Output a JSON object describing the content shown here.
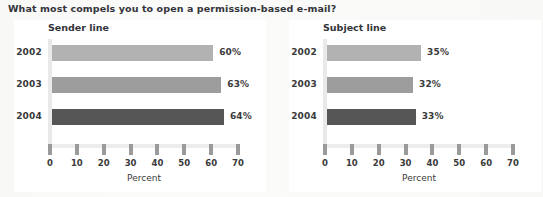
{
  "figure": {
    "title": "What most compels you to open a permission-based e-mail?"
  },
  "axis": {
    "title": "Percent",
    "ticks": [
      "0",
      "10",
      "20",
      "30",
      "40",
      "50",
      "60",
      "70"
    ]
  },
  "panels": [
    {
      "key": "sender",
      "title": "Sender line",
      "rows": [
        {
          "label": "2002",
          "value": 60,
          "value_label": "60%"
        },
        {
          "label": "2003",
          "value": 63,
          "value_label": "63%"
        },
        {
          "label": "2004",
          "value": 64,
          "value_label": "64%"
        }
      ]
    },
    {
      "key": "subject",
      "title": "Subject line",
      "rows": [
        {
          "label": "2002",
          "value": 35,
          "value_label": "35%"
        },
        {
          "label": "2003",
          "value": 32,
          "value_label": "32%"
        },
        {
          "label": "2004",
          "value": 33,
          "value_label": "33%"
        }
      ]
    }
  ],
  "colors": {
    "bar_2002": "#b2b2b2",
    "bar_2003": "#9d9d9d",
    "bar_2004": "#565656",
    "axis": "#ededed",
    "tick": "#9a9a9a",
    "text": "#3a3a3a",
    "panel_background": "#ffffff",
    "page_background": "#fbfbfa"
  },
  "chart_data": {
    "type": "bar",
    "orientation": "horizontal",
    "title": "What most compels you to open a permission-based e-mail?",
    "xlabel": "Percent",
    "ylabel": "",
    "xlim": [
      0,
      70
    ],
    "xticks": [
      0,
      10,
      20,
      30,
      40,
      50,
      60,
      70
    ],
    "grid": false,
    "legend": "none",
    "categories": [
      "2002",
      "2003",
      "2004"
    ],
    "panels": [
      {
        "title": "Sender line",
        "values": [
          60,
          63,
          64
        ],
        "data_labels": [
          "60%",
          "63%",
          "64%"
        ]
      },
      {
        "title": "Subject line",
        "values": [
          35,
          32,
          33
        ],
        "data_labels": [
          "35%",
          "32%",
          "33%"
        ]
      }
    ],
    "series": [
      {
        "name": "Sender line",
        "values": [
          60,
          63,
          64
        ]
      },
      {
        "name": "Subject line",
        "values": [
          35,
          32,
          33
        ]
      }
    ],
    "units": "percent"
  }
}
